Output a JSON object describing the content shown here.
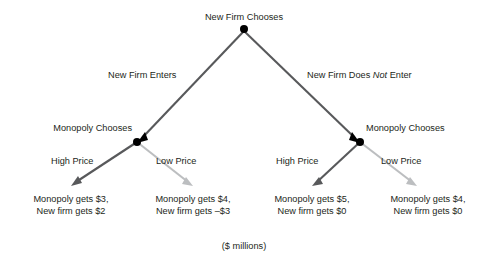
{
  "diagram": {
    "caption": "($ millions)",
    "colors": {
      "edge_dark": "#58595b",
      "edge_light": "#bcbec0",
      "node": "#000000",
      "text": "#231f20",
      "background": "#ffffff"
    },
    "root": {
      "label": "New Firm Chooses"
    },
    "level1_branches": [
      {
        "label": "New Firm Enters",
        "emphasis": ""
      },
      {
        "label_pre": "New Firm Does ",
        "emphasis": "Not",
        "label_post": " Enter"
      }
    ],
    "decision_nodes": [
      {
        "label": "Monopoly Chooses"
      },
      {
        "label": "Monopoly Chooses"
      }
    ],
    "level2_branches": [
      {
        "label": "High Price"
      },
      {
        "label": "Low Price"
      },
      {
        "label": "High Price"
      },
      {
        "label": "Low Price"
      }
    ],
    "outcomes": [
      {
        "line1": "Monopoly gets $3,",
        "line2": "New firm gets $2"
      },
      {
        "line1": "Monopoly gets $4,",
        "line2": "New firm gets –$3"
      },
      {
        "line1": "Monopoly gets $5,",
        "line2": "New firm gets $0"
      },
      {
        "line1": "Monopoly gets $4,",
        "line2": "New firm gets $0"
      }
    ]
  }
}
